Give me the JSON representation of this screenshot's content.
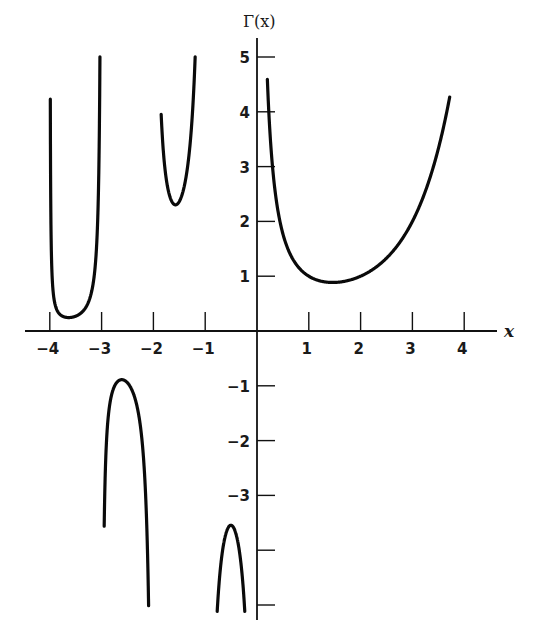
{
  "chart_data": {
    "type": "line",
    "title": "",
    "xlabel": "x",
    "ylabel": "Γ(x)",
    "function": "Gamma function Γ(x)",
    "xlim": [
      -4.5,
      4.6
    ],
    "ylim": [
      -5,
      5
    ],
    "grid": false,
    "legend": null,
    "x_ticks": [
      -4,
      -3,
      -2,
      -1,
      1,
      2,
      3,
      4
    ],
    "x_tick_labels": [
      "−4",
      "−3",
      "−2",
      "−1",
      "1",
      "2",
      "3",
      "4"
    ],
    "y_ticks": [
      5,
      4,
      3,
      2,
      1,
      -1,
      -2,
      -3,
      -4,
      -5
    ],
    "y_tick_labels": [
      "5",
      "4",
      "3",
      "2",
      "1",
      "−1",
      "−2",
      "−3",
      "",
      ""
    ],
    "series": [
      {
        "name": "Γ(x), 0 < x ≤ 3.7",
        "x_range": [
          0.2,
          3.72
        ],
        "minimum": {
          "x": 1.46,
          "y": 0.886
        },
        "points": [
          [
            0.2,
            4.59
          ],
          [
            0.5,
            1.77
          ],
          [
            1,
            1
          ],
          [
            1.46,
            0.886
          ],
          [
            2,
            1
          ],
          [
            3,
            2
          ],
          [
            3.7,
            4.17
          ]
        ]
      },
      {
        "name": "Γ(x), −1 < x < 0",
        "x_range": [
          -0.8,
          -0.2
        ],
        "maximum": {
          "x": -0.5,
          "y": -3.545
        },
        "points": [
          [
            -0.8,
            -5.82
          ],
          [
            -0.5,
            -3.545
          ],
          [
            -0.25,
            -4.9
          ]
        ]
      },
      {
        "name": "Γ(x), −2 < x < −1",
        "x_range": [
          -1.85,
          -1.15
        ],
        "minimum": {
          "x": -1.5,
          "y": 2.363
        },
        "points": [
          [
            -1.85,
            5.1
          ],
          [
            -1.5,
            2.363
          ],
          [
            -1.15,
            5.2
          ]
        ]
      },
      {
        "name": "Γ(x), −3 < x < −2",
        "x_range": [
          -2.95,
          -2.05
        ],
        "maximum": {
          "x": -2.61,
          "y": -0.888
        },
        "points": [
          [
            -2.95,
            -5.4
          ],
          [
            -2.61,
            -0.888
          ],
          [
            -2.5,
            -0.945
          ],
          [
            -2.05,
            -5.2
          ]
        ]
      },
      {
        "name": "Γ(x), −4 < x < −3",
        "x_range": [
          -3.99,
          -3.01
        ],
        "minimum": {
          "x": -3.64,
          "y": 0.245
        },
        "points": [
          [
            -3.99,
            5.2
          ],
          [
            -3.64,
            0.245
          ],
          [
            -3.5,
            0.27
          ],
          [
            -3.01,
            5.0
          ]
        ]
      }
    ]
  },
  "layout": {
    "origin_px": [
      257,
      331
    ],
    "x_px_per_unit": 51.8,
    "y_px_per_unit": 54.8,
    "x_axis_px": [
      25,
      497
    ],
    "y_axis_px": [
      38,
      620
    ],
    "curve_clip_top": 5.0,
    "curve_clip_bottom": -5.1
  }
}
